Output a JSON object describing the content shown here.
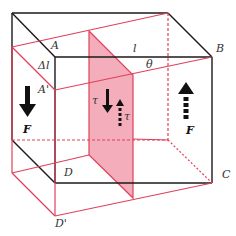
{
  "diagram": {
    "colors": {
      "original_edges": "#1a1a1a",
      "deformed_edges": "#e0405a",
      "shear_plane_fill": "#f08a9c",
      "shear_plane_opacity": "0.7",
      "arrows": "#111111"
    },
    "labels": {
      "A": "A",
      "A_prime": "A'",
      "B": "B",
      "C": "C",
      "D": "D",
      "D_prime": "D'",
      "delta_l": "Δl",
      "l": "l",
      "theta": "θ",
      "tau_left": "τ",
      "tau_right": "τ",
      "F_left": "F",
      "F_right": "F"
    },
    "arrows": [
      {
        "name": "force-left-down",
        "direction": "down",
        "style": "solid"
      },
      {
        "name": "force-right-up",
        "direction": "up",
        "style": "dashed"
      },
      {
        "name": "shear-stress-down",
        "direction": "down",
        "style": "solid"
      },
      {
        "name": "shear-stress-up",
        "direction": "up",
        "style": "dashed"
      }
    ]
  }
}
